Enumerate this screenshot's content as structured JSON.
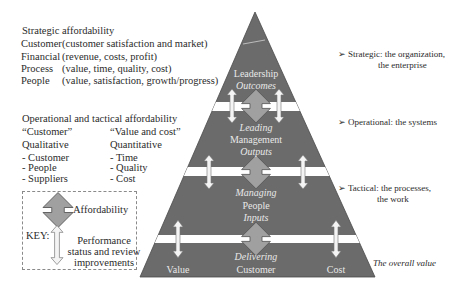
{
  "strategic": {
    "title": "Strategic affordability",
    "rows": [
      {
        "label": "Customer",
        "desc": "(customer satisfaction and market)"
      },
      {
        "label": "Financial",
        "desc": "(revenue, costs, profit)"
      },
      {
        "label": "Process",
        "desc": "(value, time, quality, cost)"
      },
      {
        "label": "People",
        "desc": "(value, satisfaction, growth/progress)"
      }
    ]
  },
  "operational": {
    "title": "Operational and tactical affordability",
    "left": {
      "heading": "“Customer”",
      "type": "Qualitative",
      "items": [
        "- Customer",
        "- People",
        "- Suppliers"
      ]
    },
    "right": {
      "heading": "“Value and cost”",
      "type": "Quantitative",
      "items": [
        "- Time",
        "- Quality",
        "- Cost"
      ]
    }
  },
  "key": {
    "label": "KEY:",
    "affordability": "Affordability",
    "performance_lines": [
      "Performance",
      "status and review",
      "improvements"
    ],
    "icons": [
      "affordability-double-arrow-icon",
      "performance-double-arrow-icon"
    ]
  },
  "pyramid": {
    "colors": {
      "fill": "#6b6b6b",
      "band": "#ffffff",
      "big_arrow": "#a0a0a0",
      "text": "#e8e8e8"
    },
    "level1": {
      "title": "Leadership",
      "sub": "Outcomes"
    },
    "level2": {
      "top": "Leading",
      "title": "Management",
      "sub": "Outputs"
    },
    "level3": {
      "top": "Managing",
      "title": "People",
      "sub": "Inputs"
    },
    "level4": {
      "top": "Delivering",
      "left": "Value",
      "center": "Customer",
      "right": "Cost"
    }
  },
  "levels": {
    "strategic": [
      "Strategic: the organization,",
      "the enterprise"
    ],
    "operational": [
      "Operational: the systems"
    ],
    "tactical": [
      "Tactical: the processes,",
      "the work"
    ],
    "overall": "The overall value",
    "bullet": "➢"
  }
}
